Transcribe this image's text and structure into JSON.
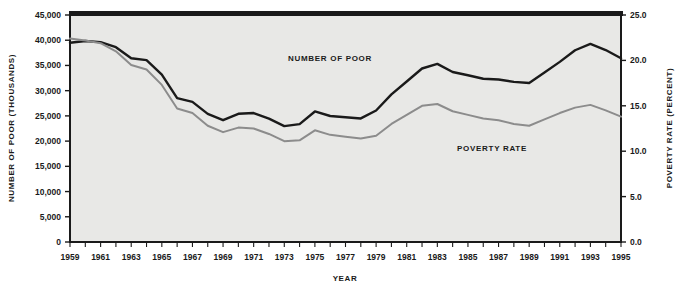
{
  "chart_data": {
    "type": "line",
    "title": "",
    "xlabel": "Year",
    "ylabel": "Number of Poor (Thousands)",
    "y2label": "Poverty Rate (Percent)",
    "grid": false,
    "legend_position": "inline-annotations",
    "x": [
      1959,
      1960,
      1961,
      1962,
      1963,
      1964,
      1965,
      1966,
      1967,
      1968,
      1969,
      1970,
      1971,
      1972,
      1973,
      1974,
      1975,
      1976,
      1977,
      1978,
      1979,
      1980,
      1981,
      1982,
      1983,
      1984,
      1985,
      1986,
      1987,
      1988,
      1989,
      1990,
      1991,
      1992,
      1993,
      1994,
      1995
    ],
    "xlim": [
      1959,
      1995
    ],
    "ylim": [
      0,
      45000
    ],
    "y2lim": [
      0.0,
      25.0
    ],
    "yticks": [
      "0",
      "5,000",
      "10,000",
      "15,000",
      "20,000",
      "25,000",
      "30,000",
      "35,000",
      "40,000",
      "45,000"
    ],
    "ytick_values": [
      0,
      5000,
      10000,
      15000,
      20000,
      25000,
      30000,
      35000,
      40000,
      45000
    ],
    "y2ticks": [
      "0.0",
      "5.0",
      "10.0",
      "15.0",
      "20.0",
      "25.0"
    ],
    "y2tick_values": [
      0,
      5,
      10,
      15,
      20,
      25
    ],
    "xticks": [
      "1959",
      "1961",
      "1963",
      "1965",
      "1967",
      "1969",
      "1971",
      "1973",
      "1975",
      "1977",
      "1979",
      "1981",
      "1983",
      "1985",
      "1987",
      "1989",
      "1991",
      "1993",
      "1995"
    ],
    "series": [
      {
        "name": "Number of Poor",
        "axis": "left",
        "color": "#1a1a1a",
        "units": "thousands",
        "values": [
          39490,
          39851,
          39628,
          38625,
          36436,
          36055,
          33185,
          28510,
          27769,
          25389,
          24147,
          25420,
          25559,
          24460,
          22973,
          23370,
          25877,
          24975,
          24720,
          24497,
          26072,
          29272,
          31822,
          34398,
          35303,
          33700,
          33064,
          32370,
          32221,
          31745,
          31528,
          33585,
          35708,
          38014,
          39265,
          38059,
          36425
        ]
      },
      {
        "name": "Poverty Rate",
        "axis": "right",
        "color": "#8c8c8c",
        "units": "percent",
        "values": [
          22.4,
          22.2,
          21.9,
          21.0,
          19.5,
          19.0,
          17.3,
          14.7,
          14.2,
          12.8,
          12.1,
          12.6,
          12.5,
          11.9,
          11.1,
          11.2,
          12.3,
          11.8,
          11.6,
          11.4,
          11.7,
          13.0,
          14.0,
          15.0,
          15.2,
          14.4,
          14.0,
          13.6,
          13.4,
          13.0,
          12.8,
          13.5,
          14.2,
          14.8,
          15.1,
          14.5,
          13.8
        ]
      }
    ],
    "annotations": [
      {
        "text": "Number of Poor",
        "x_px": 330,
        "y_px": 61
      },
      {
        "text": "Poverty Rate",
        "x_px": 492,
        "y_px": 151
      }
    ]
  },
  "axes": {
    "left_title": "Number of Poor (Thousands)",
    "right_title": "Poverty Rate (Percent)",
    "bottom_title": "Year"
  },
  "colors": {
    "plot_background": "#e8e8e6",
    "page_background": "#ffffff",
    "axis": "#1a1a1a",
    "series_number_of_poor": "#1a1a1a",
    "series_poverty_rate": "#8c8c8c"
  }
}
